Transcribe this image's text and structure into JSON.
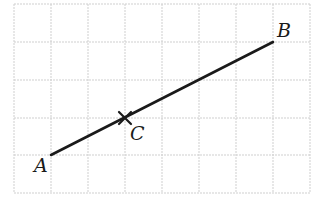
{
  "figure": {
    "type": "grid-geometry",
    "grid": {
      "columns": 8,
      "rows": 5,
      "x_lines": [
        14,
        51,
        88,
        125,
        162,
        199,
        236,
        273,
        310
      ],
      "y_lines": [
        4,
        42,
        80,
        118,
        155,
        193
      ],
      "color": "#cfcfcf"
    },
    "segment": {
      "from": "A",
      "to": "B",
      "color": "#1a1a1a"
    },
    "points": [
      {
        "label": "A",
        "grid": [
          1,
          4
        ],
        "px": [
          51,
          155
        ],
        "label_pos": [
          34,
          172
        ]
      },
      {
        "label": "B",
        "grid": [
          7,
          1
        ],
        "px": [
          273,
          42
        ],
        "label_pos": [
          277,
          37
        ]
      },
      {
        "label": "C",
        "grid": [
          3,
          3
        ],
        "px": [
          125,
          118
        ],
        "label_pos": [
          130,
          140
        ],
        "marker": "cross"
      }
    ]
  }
}
